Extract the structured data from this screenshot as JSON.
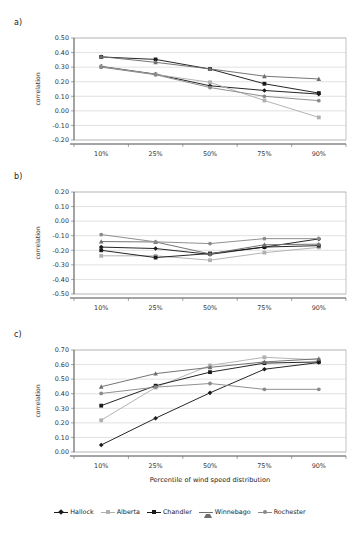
{
  "figure": {
    "panels": [
      {
        "id": "a",
        "label": "a)"
      },
      {
        "id": "b",
        "label": "b)"
      },
      {
        "id": "c",
        "label": "c)"
      }
    ],
    "xaxis_title": "Percentile of wind speed distribution",
    "yaxis_title": "correlation"
  },
  "legend": {
    "position": "bottom-center",
    "entries": [
      {
        "name": "Hallock",
        "color": "#1a1a1a",
        "marker": "diamond"
      },
      {
        "name": "Alberta",
        "color": "#b0b0b0",
        "marker": "square"
      },
      {
        "name": "Chandler",
        "color": "#1a1a1a",
        "marker": "square"
      },
      {
        "name": "Winnebago",
        "color": "#6e6e6e",
        "marker": "triangle"
      },
      {
        "name": "Rochester",
        "color": "#8a8a8a",
        "marker": "circle"
      }
    ]
  },
  "chart_data": [
    {
      "id": "a",
      "type": "line",
      "title": "a)",
      "xlabel": "",
      "ylabel": "correlation",
      "categories": [
        "10%",
        "25%",
        "50%",
        "75%",
        "90%"
      ],
      "ylim": [
        -0.2,
        0.5
      ],
      "yticks": [
        "0.50",
        "0.40",
        "0.30",
        "0.20",
        "0.10",
        "0.00",
        "-0.10",
        "-0.20"
      ],
      "ytick_values": [
        0.5,
        0.4,
        0.3,
        0.2,
        0.1,
        0.0,
        -0.1,
        -0.2
      ],
      "grid": true,
      "series": [
        {
          "name": "Hallock",
          "color": "#1a1a1a",
          "marker": "diamond",
          "values": [
            0.305,
            0.252,
            0.172,
            0.14,
            0.115
          ]
        },
        {
          "name": "Alberta",
          "color": "#b0b0b0",
          "marker": "square",
          "values": [
            0.303,
            0.25,
            0.196,
            0.071,
            -0.045
          ]
        },
        {
          "name": "Chandler",
          "color": "#1a1a1a",
          "marker": "square",
          "values": [
            0.37,
            0.353,
            0.287,
            0.186,
            0.122
          ]
        },
        {
          "name": "Winnebago",
          "color": "#6e6e6e",
          "marker": "triangle",
          "values": [
            0.372,
            0.333,
            0.288,
            0.238,
            0.219
          ]
        },
        {
          "name": "Rochester",
          "color": "#8a8a8a",
          "marker": "circle",
          "values": [
            0.3,
            0.248,
            0.16,
            0.1,
            0.07
          ]
        }
      ]
    },
    {
      "id": "b",
      "type": "line",
      "title": "b)",
      "xlabel": "",
      "ylabel": "correlation",
      "categories": [
        "10%",
        "25%",
        "50%",
        "75%",
        "90%"
      ],
      "ylim": [
        -0.5,
        0.2
      ],
      "yticks": [
        "0.20",
        "0.10",
        "0.00",
        "-0.10",
        "-0.20",
        "-0.30",
        "-0.40",
        "-0.50"
      ],
      "ytick_values": [
        0.2,
        0.1,
        0.0,
        -0.1,
        -0.2,
        -0.3,
        -0.4,
        -0.5
      ],
      "grid": true,
      "series": [
        {
          "name": "Hallock",
          "color": "#1a1a1a",
          "marker": "diamond",
          "values": [
            -0.178,
            -0.188,
            -0.228,
            -0.178,
            -0.122
          ]
        },
        {
          "name": "Alberta",
          "color": "#b0b0b0",
          "marker": "square",
          "values": [
            -0.238,
            -0.238,
            -0.268,
            -0.216,
            -0.18
          ]
        },
        {
          "name": "Chandler",
          "color": "#1a1a1a",
          "marker": "square",
          "values": [
            -0.2,
            -0.25,
            -0.222,
            -0.178,
            -0.168
          ]
        },
        {
          "name": "Winnebago",
          "color": "#6e6e6e",
          "marker": "triangle",
          "values": [
            -0.14,
            -0.143,
            -0.225,
            -0.162,
            -0.158
          ]
        },
        {
          "name": "Rochester",
          "color": "#8a8a8a",
          "marker": "circle",
          "values": [
            -0.092,
            -0.142,
            -0.154,
            -0.12,
            -0.12
          ]
        }
      ]
    },
    {
      "id": "c",
      "type": "line",
      "title": "c)",
      "xlabel": "Percentile of wind speed distribution",
      "ylabel": "correlation",
      "categories": [
        "10%",
        "25%",
        "50%",
        "75%",
        "90%"
      ],
      "ylim": [
        0.0,
        0.7
      ],
      "yticks": [
        "0.70",
        "0.60",
        "0.50",
        "0.40",
        "0.30",
        "0.20",
        "0.10",
        "0.00"
      ],
      "ytick_values": [
        0.7,
        0.6,
        0.5,
        0.4,
        0.3,
        0.2,
        0.1,
        0.0
      ],
      "grid": true,
      "series": [
        {
          "name": "Hallock",
          "color": "#1a1a1a",
          "marker": "diamond",
          "values": [
            0.048,
            0.232,
            0.406,
            0.568,
            0.614
          ]
        },
        {
          "name": "Alberta",
          "color": "#b0b0b0",
          "marker": "square",
          "values": [
            0.218,
            0.443,
            0.594,
            0.65,
            0.632
          ]
        },
        {
          "name": "Chandler",
          "color": "#1a1a1a",
          "marker": "square",
          "values": [
            0.318,
            0.455,
            0.548,
            0.61,
            0.618
          ]
        },
        {
          "name": "Winnebago",
          "color": "#6e6e6e",
          "marker": "triangle",
          "values": [
            0.448,
            0.538,
            0.581,
            0.618,
            0.64
          ]
        },
        {
          "name": "Rochester",
          "color": "#8a8a8a",
          "marker": "circle",
          "values": [
            0.402,
            0.445,
            0.47,
            0.43,
            0.43
          ]
        }
      ]
    }
  ]
}
